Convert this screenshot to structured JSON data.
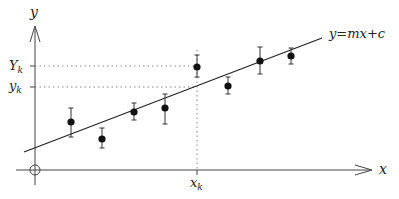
{
  "diagram": {
    "axes": {
      "x_label": "x",
      "y_label": "y",
      "origin_marker": "circle"
    },
    "fit_line": {
      "label": "y=mx+c",
      "equation_parts": {
        "lhs": "y",
        "eq": "=",
        "m": "m",
        "x": "x",
        "plus": "+",
        "c": "c"
      }
    },
    "annotations": {
      "x_k": {
        "base": "x",
        "sub": "k"
      },
      "Y_k": {
        "base": "Y",
        "sub": "k"
      },
      "y_k": {
        "base": "y",
        "sub": "k"
      }
    },
    "points": [
      {
        "px": 71,
        "py": 122,
        "err_top": 108,
        "err_bot": 137
      },
      {
        "px": 102,
        "py": 139,
        "err_top": 128,
        "err_bot": 148
      },
      {
        "px": 134,
        "py": 112,
        "err_top": 103,
        "err_bot": 120
      },
      {
        "px": 165,
        "py": 108,
        "err_top": 94,
        "err_bot": 124
      },
      {
        "px": 197,
        "py": 67,
        "err_top": 55,
        "err_bot": 77
      },
      {
        "px": 228,
        "py": 86,
        "err_top": 77,
        "err_bot": 94
      },
      {
        "px": 260,
        "py": 61,
        "err_top": 47,
        "err_bot": 74
      },
      {
        "px": 291,
        "py": 56,
        "err_top": 48,
        "err_bot": 64
      }
    ],
    "colors": {
      "ink": "#222222",
      "dotted": "#888888",
      "axis": "#444444"
    }
  }
}
